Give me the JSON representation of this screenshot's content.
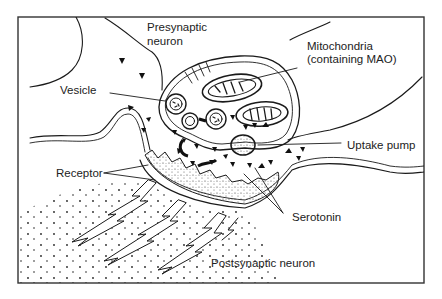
{
  "figure": {
    "frame_color": "#333333",
    "ink_color": "#1a1a1a",
    "background": "#ffffff"
  },
  "labels": {
    "presynaptic_line1": "Presynaptic",
    "presynaptic_line2": "neuron",
    "mitochondria_line1": "Mitochondria",
    "mitochondria_line2": "(containing MAO)",
    "vesicle": "Vesicle",
    "uptake_pump": "Uptake pump",
    "receptor": "Receptor",
    "serotonin": "Serotonin",
    "postsynaptic": "Postsynaptic neuron"
  }
}
